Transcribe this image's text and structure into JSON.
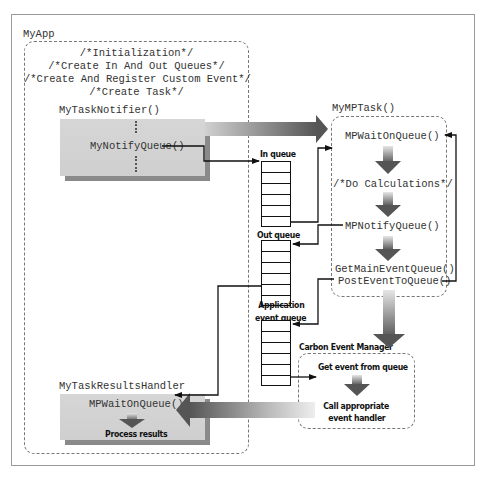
{
  "frame": {
    "app_label": "MyApp"
  },
  "my_app": {
    "init_comments": [
      "/*Initialization*/",
      "/*Create In And Out Queues*/",
      "/*Create And Register Custom Event*/",
      "/*Create Task*/"
    ],
    "task_notifier": {
      "title": "MyTaskNotifier()",
      "call": "MyNotifyQueue()"
    },
    "results_handler": {
      "title": "MyTaskResultsHandler",
      "call": "MPWaitOnQueue()",
      "action": "Process results"
    }
  },
  "queues": {
    "in_queue": {
      "label": "In queue",
      "cells": 6
    },
    "out_queue": {
      "label": "Out queue",
      "cells": 6
    },
    "app_event_queue": {
      "label_line1": "Application",
      "label_line2": "event queue",
      "cells": 6
    }
  },
  "mp_task": {
    "title": "MyMPTask()",
    "steps": [
      "MPWaitOnQueue()",
      "/*Do Calculations*/",
      "MPNotifyQueue()",
      "GetMainEventQueue()",
      "PostEventToQueue()"
    ]
  },
  "carbon_event_manager": {
    "title": "Carbon Event Manager",
    "steps": [
      "Get event from queue",
      "Call appropriate event handler"
    ],
    "step2_line1": "Call appropriate",
    "step2_line2": "event handler"
  },
  "colors": {
    "box_fill": "#d3d3d3",
    "box_shadow": "#8a8a8a",
    "arrow_dark": "#5a5a5a",
    "line": "#111111",
    "dashed_border": "#777777",
    "frame_border": "#9a9a9a"
  }
}
